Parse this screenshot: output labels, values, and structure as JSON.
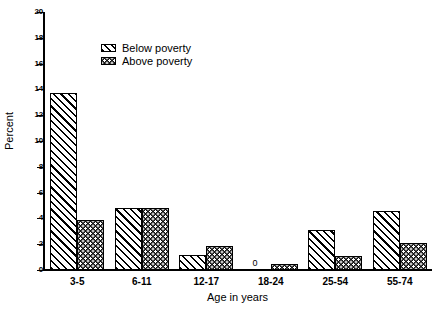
{
  "chart_data": {
    "type": "bar",
    "title": "",
    "xlabel": "Age in years",
    "ylabel": "Percent",
    "ylim": [
      0,
      20
    ],
    "yticks": [
      0,
      2,
      4,
      6,
      8,
      10,
      12,
      14,
      16,
      18,
      20
    ],
    "ytick_labels": [
      "0",
      "2",
      "4",
      "6",
      "8",
      "10",
      "12",
      "14",
      "16",
      "18",
      "20"
    ],
    "grid": false,
    "legend_position": "upper-left-inside",
    "categories": [
      "3-5",
      "6-11",
      "12-17",
      "18-24",
      "25-54",
      "55-74"
    ],
    "series": [
      {
        "name": "Below poverty",
        "pattern": "diagonal-hatch",
        "color": "#ffffff",
        "values": [
          13.7,
          4.8,
          1.2,
          0,
          3.1,
          4.6
        ]
      },
      {
        "name": "Above poverty",
        "pattern": "dark-dotted",
        "color": "#111111",
        "values": [
          3.9,
          4.8,
          1.9,
          0.5,
          1.1,
          2.1
        ]
      }
    ],
    "annotations": [
      {
        "text": "0",
        "category": "18-24",
        "series": "Below poverty"
      }
    ]
  },
  "legend": {
    "items": [
      {
        "label": "Below poverty"
      },
      {
        "label": "Above poverty"
      }
    ]
  },
  "caption": {
    "text": ""
  }
}
